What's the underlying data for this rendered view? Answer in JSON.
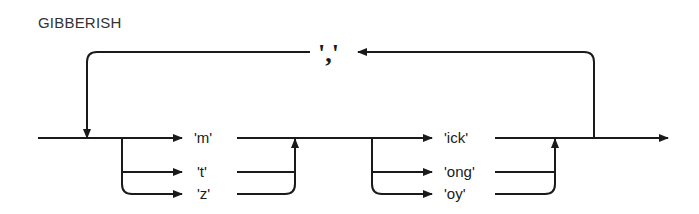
{
  "title": "GIBBERISH",
  "diagram": {
    "type": "railroad / syntax diagram",
    "loop_separator": "','",
    "group1": {
      "options": [
        "'m'",
        "'t'",
        "'z'"
      ]
    },
    "group2": {
      "options": [
        "'ick'",
        "'ong'",
        "'oy'"
      ]
    }
  },
  "colors": {
    "stroke": "#1a1a1a",
    "background": "#ffffff"
  }
}
